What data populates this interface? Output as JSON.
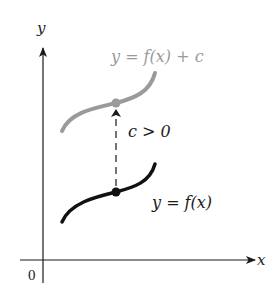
{
  "diagram": {
    "axes": {
      "x_label": "x",
      "y_label": "y",
      "origin_label": "0",
      "axis_color": "#1a1a1a"
    },
    "curves": [
      {
        "name": "shifted",
        "label": "y = f(x) + c",
        "color": "#9a9a9a"
      },
      {
        "name": "original",
        "label": "y = f(x)",
        "color": "#111111"
      }
    ],
    "shift": {
      "label": "c > 0",
      "style": "dashed-arrow-up"
    }
  }
}
